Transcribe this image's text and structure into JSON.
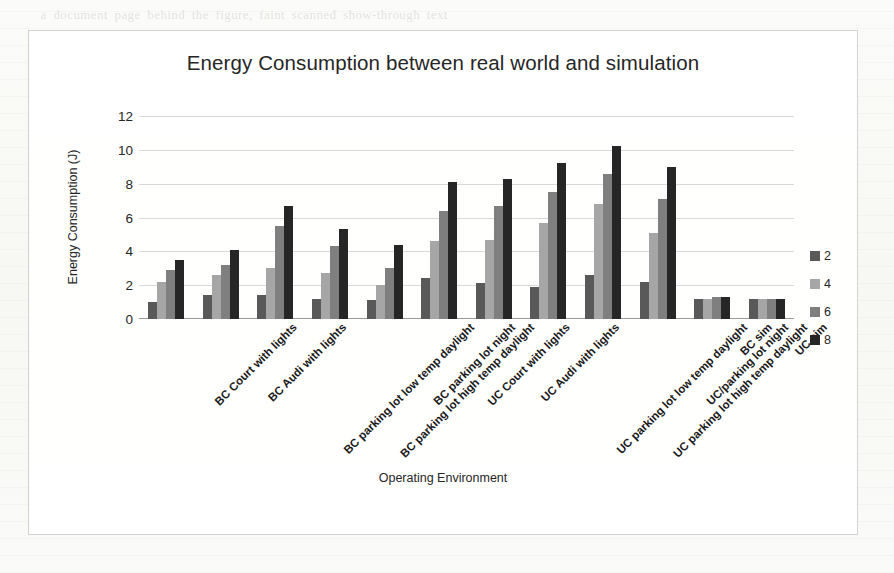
{
  "page": {
    "ghost_text": "    a document page behind the figure, faint scanned show-through text    \n\n\n\n\n\n\n\n\n\n\n\n\n\n\n\n\n\n\n\n\n\n\n\n\n\n\n"
  },
  "chart_card": {
    "x_axis_title": "Operating Environment"
  },
  "chart_data": {
    "type": "bar",
    "title": "Energy Consumption between real world and simulation",
    "xlabel": "Operating Environment",
    "ylabel": "Energy Consumption (J)",
    "ylim": [
      0,
      12
    ],
    "yticks": [
      0,
      2,
      4,
      6,
      8,
      10,
      12
    ],
    "grid": true,
    "legend_position": "right",
    "legend_title": "",
    "categories": [
      "BC Court with lights",
      "BC Audi with lights",
      "BC parking lot low temp daylight",
      "BC parking lot high temp daylight",
      "BC parking lot  night",
      "UC Court with lights",
      "UC Audi with lights",
      "UC parking lot low temp daylight",
      "UC parking lot high temp daylight",
      "UC/parking lot  night",
      "BC sim",
      "UC sim"
    ],
    "series": [
      {
        "name": "2",
        "color": "#595959",
        "values": [
          1.0,
          1.4,
          1.4,
          1.2,
          1.1,
          2.4,
          2.1,
          1.9,
          2.6,
          2.2,
          1.2,
          1.2
        ]
      },
      {
        "name": "4",
        "color": "#a6a6a6",
        "values": [
          2.2,
          2.6,
          3.0,
          2.7,
          2.0,
          4.6,
          4.7,
          5.7,
          6.8,
          5.1,
          1.2,
          1.2
        ]
      },
      {
        "name": "6",
        "color": "#7f7f7f",
        "values": [
          2.9,
          3.2,
          5.5,
          4.3,
          3.0,
          6.4,
          6.7,
          7.5,
          8.6,
          7.1,
          1.3,
          1.2
        ]
      },
      {
        "name": "8",
        "color": "#262626",
        "values": [
          3.5,
          4.1,
          6.7,
          5.3,
          4.4,
          8.1,
          8.3,
          9.2,
          10.2,
          9.0,
          1.3,
          1.2
        ]
      }
    ]
  }
}
